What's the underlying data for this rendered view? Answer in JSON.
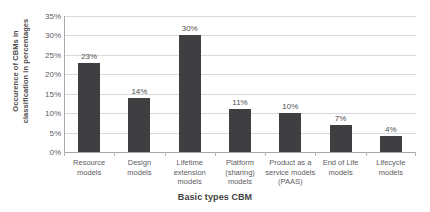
{
  "chart_data": {
    "type": "bar",
    "title": "",
    "xlabel": "Basic types CBM",
    "ylabel": "Occurence of CBMs in classification in percentages",
    "ylabel_lines": [
      "Occurence of CBMs in",
      "classification in percentages"
    ],
    "categories": [
      "Resource models",
      "Design models",
      "Lifetime extension models",
      "Platform (sharing) models",
      "Product as a service models (PAAS)",
      "End of Life models",
      "Lifecycle models"
    ],
    "category_lines": [
      [
        "Resource",
        "models"
      ],
      [
        "Design",
        "models"
      ],
      [
        "Lifetime",
        "extension",
        "models"
      ],
      [
        "Platform",
        "(sharing)",
        "models"
      ],
      [
        "Product as a",
        "service models",
        "(PAAS)"
      ],
      [
        "End of Life",
        "models"
      ],
      [
        "Lifecycle",
        "models"
      ]
    ],
    "values": [
      23,
      14,
      30,
      11,
      10,
      7,
      4
    ],
    "value_labels": [
      "23%",
      "14%",
      "30%",
      "11%",
      "10%",
      "7%",
      "4%"
    ],
    "ylim": [
      0,
      35
    ],
    "ytick_values": [
      0,
      5,
      10,
      15,
      20,
      25,
      30,
      35
    ],
    "ytick_labels": [
      "0%",
      "5%",
      "10%",
      "15%",
      "20%",
      "25%",
      "30%",
      "35%"
    ],
    "grid": true,
    "legend": "none",
    "colors": {
      "bar": "#3f3f41",
      "gridline": "#d9d9dd",
      "axis_line": "#a9a9ad",
      "text": "#5d5d5f",
      "background": "#ffffff"
    }
  }
}
